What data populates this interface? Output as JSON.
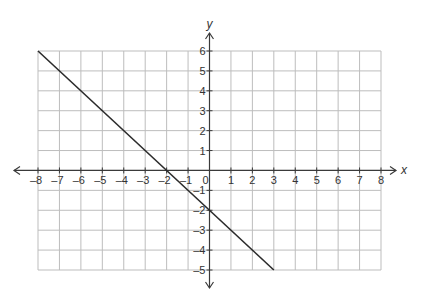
{
  "chart_data": {
    "type": "line",
    "title": "",
    "xlabel": "x",
    "ylabel": "y",
    "xlim": [
      -8,
      8
    ],
    "ylim": [
      -5,
      6
    ],
    "grid": true,
    "x_ticks": [
      -8,
      -7,
      -6,
      -5,
      -4,
      -3,
      -2,
      -1,
      0,
      1,
      2,
      3,
      4,
      5,
      6,
      7,
      8
    ],
    "y_ticks": [
      -5,
      -4,
      -3,
      -2,
      -1,
      1,
      2,
      3,
      4,
      5,
      6
    ],
    "x_tick_labels": [
      "–8",
      "–7",
      "–6",
      "–5",
      "–4",
      "–3",
      "–2",
      "–1",
      "0",
      "1",
      "2",
      "3",
      "4",
      "5",
      "6",
      "7",
      "8"
    ],
    "y_tick_labels": [
      "–5",
      "–4",
      "–3",
      "–2",
      "–1",
      "1",
      "2",
      "3",
      "4",
      "5",
      "6"
    ],
    "series": [
      {
        "name": "line",
        "x": [
          -8,
          3
        ],
        "y": [
          6,
          -5
        ],
        "equation": "y = -x - 2",
        "slope": -1,
        "y_intercept": -2,
        "x_intercept": -2
      }
    ],
    "axis_arrows": true,
    "legend": null
  },
  "layout": {
    "px_left": 38,
    "px_right": 381,
    "px_top": 51,
    "px_bottom": 270,
    "colors": {
      "grid": "#bdbdbd",
      "axis": "#3a3a3a",
      "line": "#2b2b2b"
    }
  }
}
